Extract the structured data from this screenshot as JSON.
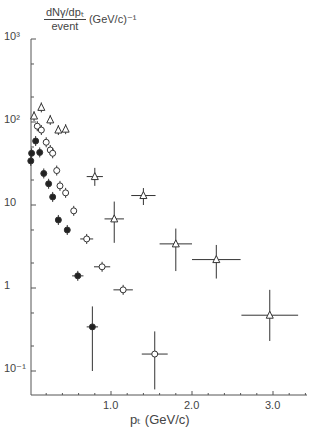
{
  "chart_data": {
    "type": "scatter",
    "title": "",
    "ylabel_numerator": "dNγ/dpₜ",
    "ylabel_denominator": "event",
    "ylabel_units": "(GeV/c)⁻¹",
    "xlabel": "pₜ  (GeV/c)",
    "yscale": "log",
    "xlim": [
      0,
      3.4
    ],
    "ylim": [
      0.05,
      1000
    ],
    "xticks": [
      "1.0",
      "2.0",
      "3.0"
    ],
    "yticks": [
      "10³",
      "10²",
      "10",
      "1",
      "10⁻¹"
    ],
    "grid": false,
    "series": [
      {
        "name": "open triangles",
        "marker": "triangle-open",
        "points": [
          {
            "x": 0.05,
            "y": 118
          },
          {
            "x": 0.14,
            "y": 150
          },
          {
            "x": 0.25,
            "y": 106
          },
          {
            "x": 0.35,
            "y": 80
          },
          {
            "x": 0.44,
            "y": 82
          },
          {
            "x": 0.8,
            "y": 22,
            "xerr": 0.1,
            "yerr_lo": 17,
            "yerr_hi": 28
          },
          {
            "x": 1.04,
            "y": 6.8,
            "xerr": 0.12,
            "yerr_lo": 3.5,
            "yerr_hi": 11
          },
          {
            "x": 1.4,
            "y": 13,
            "xerr": 0.15,
            "yerr_lo": 10,
            "yerr_hi": 16
          },
          {
            "x": 1.8,
            "y": 3.4,
            "xerr": 0.2,
            "yerr_lo": 1.6,
            "yerr_hi": 5.2
          },
          {
            "x": 2.3,
            "y": 2.2,
            "xerr": 0.3,
            "yerr_lo": 1.3,
            "yerr_hi": 3.3
          },
          {
            "x": 2.96,
            "y": 0.47,
            "xerr": 0.35,
            "yerr_lo": 0.23,
            "yerr_hi": 0.95
          }
        ]
      },
      {
        "name": "open circles",
        "marker": "circle-open",
        "points": [
          {
            "x": 0.09,
            "y": 89
          },
          {
            "x": 0.14,
            "y": 80
          },
          {
            "x": 0.2,
            "y": 57
          },
          {
            "x": 0.25,
            "y": 46
          },
          {
            "x": 0.28,
            "y": 42
          },
          {
            "x": 0.33,
            "y": 26
          },
          {
            "x": 0.37,
            "y": 17
          },
          {
            "x": 0.44,
            "y": 14
          },
          {
            "x": 0.54,
            "y": 8.5
          },
          {
            "x": 0.7,
            "y": 3.9,
            "xerr": 0.08
          },
          {
            "x": 0.89,
            "y": 1.8,
            "xerr": 0.1
          },
          {
            "x": 1.15,
            "y": 0.95,
            "xerr": 0.12
          },
          {
            "x": 1.54,
            "y": 0.16,
            "xerr": 0.16,
            "yerr_lo": 0.06,
            "yerr_hi": 0.3
          }
        ]
      },
      {
        "name": "filled circles",
        "marker": "circle-filled",
        "points": [
          {
            "x": 0.01,
            "y": 34
          },
          {
            "x": 0.02,
            "y": 42
          },
          {
            "x": 0.07,
            "y": 59
          },
          {
            "x": 0.12,
            "y": 43
          },
          {
            "x": 0.17,
            "y": 24
          },
          {
            "x": 0.23,
            "y": 18
          },
          {
            "x": 0.28,
            "y": 12.5
          },
          {
            "x": 0.35,
            "y": 6.6
          },
          {
            "x": 0.46,
            "y": 5
          },
          {
            "x": 0.59,
            "y": 1.4,
            "xerr": 0.07
          },
          {
            "x": 0.77,
            "y": 0.34,
            "xerr": 0.07,
            "yerr_lo": 0.1,
            "yerr_hi": 0.6
          }
        ]
      }
    ]
  }
}
